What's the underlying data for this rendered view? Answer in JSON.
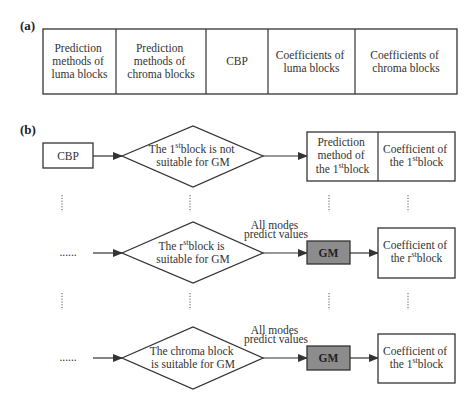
{
  "panel_a": {
    "label": "(a)",
    "cells": [
      {
        "lines": [
          "Prediction",
          "methods of",
          "luma blocks"
        ]
      },
      {
        "lines": [
          "Prediction",
          "methods of",
          "chroma blocks"
        ]
      },
      {
        "lines": [
          "CBP"
        ]
      },
      {
        "lines": [
          "Coefficients of",
          "luma blocks"
        ]
      },
      {
        "lines": [
          "Coefficients of",
          "chroma blocks"
        ]
      }
    ]
  },
  "panel_b": {
    "label": "(b)",
    "row1": {
      "start": "CBP",
      "decision": {
        "line1_pre": "The 1",
        "line1_sup": "st",
        "line1_post": "block is not",
        "line2": "suitable for GM"
      },
      "out_left": {
        "line1": "Prediction",
        "line2": "method of",
        "line3_pre": "the 1",
        "line3_sup": "st",
        "line3_post": "block"
      },
      "out_right": {
        "line1": "Coefficient of",
        "line2_pre": "the 1",
        "line2_sup": "st",
        "line2_post": "block"
      }
    },
    "row2": {
      "start": "......",
      "decision": {
        "line1_pre": "The r",
        "line1_sup": "st",
        "line1_post": "block is",
        "line2": "suitable for GM"
      },
      "edge_label": [
        "All modes",
        "predict values"
      ],
      "gm": "GM",
      "out": {
        "line1": "Coefficient of",
        "line2_pre": "the r",
        "line2_sup": "st",
        "line2_post": "block"
      }
    },
    "row3": {
      "start": "......",
      "decision": {
        "line1": "The chroma block",
        "line2": "is suitable for GM"
      },
      "edge_label": [
        "All modes",
        "predict values"
      ],
      "gm": "GM",
      "out": {
        "line1": "Coefficient of",
        "line2_pre": "the 1",
        "line2_sup": "st",
        "line2_post": "block"
      }
    },
    "vertical_ellipsis": "⋮"
  }
}
